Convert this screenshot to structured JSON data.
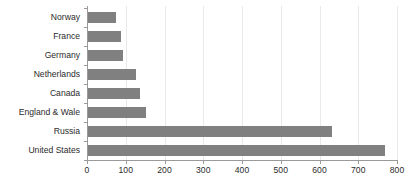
{
  "chart_data": {
    "type": "bar",
    "orientation": "horizontal",
    "title": "",
    "subtitle": "",
    "xlabel": "",
    "ylabel": "",
    "categories": [
      "Norway",
      "France",
      "Germany",
      "Netherlands",
      "Canada",
      "England & Wale",
      "Russia",
      "United States"
    ],
    "values": [
      75,
      88,
      93,
      126,
      137,
      152,
      631,
      768
    ],
    "series": [
      {
        "name": "",
        "values": [
          75,
          88,
          93,
          126,
          137,
          152,
          631,
          768
        ]
      }
    ],
    "xlim": [
      0,
      800
    ],
    "xticks": [
      0,
      100,
      200,
      300,
      400,
      500,
      600,
      700,
      800
    ],
    "xtick_labels": [
      "0",
      "100",
      "200",
      "300",
      "400",
      "500",
      "600",
      "700",
      "800"
    ],
    "grid": true,
    "grid_axis": "x",
    "legend": false,
    "legend_position": "none",
    "bar_color": "#808080",
    "grid_color": "#e9e9e9",
    "axis_color": "#9a9a9a",
    "text_color": "#2b2b2b",
    "background": "#ffffff",
    "annotations": []
  },
  "layout": {
    "plot_left": 87,
    "plot_right": 397,
    "plot_top": 8,
    "plot_bottom": 160,
    "bar_thickness": 11,
    "width": 416,
    "height": 190
  }
}
